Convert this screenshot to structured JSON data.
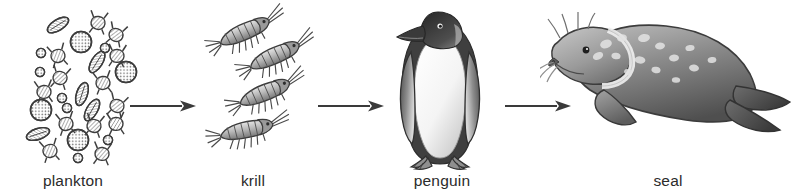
{
  "diagram": {
    "type": "linear-food-chain",
    "background_color": "#ffffff",
    "ink_color": "#3a3a3a",
    "label_color": "#2b2b2b",
    "stages": [
      {
        "id": "plankton",
        "label": "plankton",
        "icon_name": "plankton-cluster-illustration",
        "order": 1
      },
      {
        "id": "krill",
        "label": "krill",
        "icon_name": "krill-group-illustration",
        "order": 2
      },
      {
        "id": "penguin",
        "label": "penguin",
        "icon_name": "penguin-illustration",
        "order": 3
      },
      {
        "id": "seal",
        "label": "seal",
        "icon_name": "seal-illustration",
        "order": 4
      }
    ],
    "connectors": [
      {
        "id": "arrow-1",
        "icon_name": "arrow-right-icon",
        "from": "plankton",
        "to": "krill"
      },
      {
        "id": "arrow-2",
        "icon_name": "arrow-right-icon",
        "from": "krill",
        "to": "penguin"
      },
      {
        "id": "arrow-3",
        "icon_name": "arrow-right-icon",
        "from": "penguin",
        "to": "seal"
      }
    ]
  }
}
